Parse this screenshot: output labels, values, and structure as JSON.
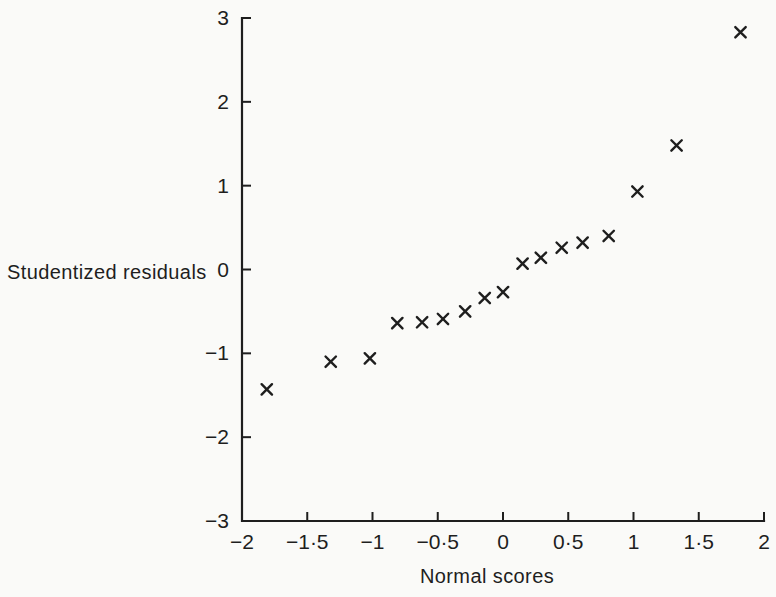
{
  "figure": {
    "paper_color": "#fafaf8",
    "ink_color": "#1e1e1e"
  },
  "chart_data": {
    "type": "scatter",
    "title": "",
    "xlabel": "Normal scores",
    "ylabel": "Studentized residuals",
    "xlim": [
      -2,
      2
    ],
    "ylim": [
      -3,
      3
    ],
    "grid": false,
    "legend_position": "none",
    "marker": "x",
    "x_ticks": [
      {
        "value": -2,
        "label": "−2"
      },
      {
        "value": -1.5,
        "label": "−1·5"
      },
      {
        "value": -1,
        "label": "−1"
      },
      {
        "value": -0.5,
        "label": "−0·5"
      },
      {
        "value": 0,
        "label": "0"
      },
      {
        "value": 0.5,
        "label": "0·5"
      },
      {
        "value": 1,
        "label": "1"
      },
      {
        "value": 1.5,
        "label": "1·5"
      },
      {
        "value": 2,
        "label": "2"
      }
    ],
    "y_ticks": [
      {
        "value": 3,
        "label": "3"
      },
      {
        "value": 2,
        "label": "2"
      },
      {
        "value": 1,
        "label": "1"
      },
      {
        "value": 0,
        "label": "0"
      },
      {
        "value": -1,
        "label": "−1"
      },
      {
        "value": -2,
        "label": "−2"
      },
      {
        "value": -3,
        "label": "−3"
      }
    ],
    "points": [
      {
        "x": -1.81,
        "y": -1.43
      },
      {
        "x": -1.32,
        "y": -1.1
      },
      {
        "x": -1.02,
        "y": -1.06
      },
      {
        "x": -0.81,
        "y": -0.64
      },
      {
        "x": -0.62,
        "y": -0.63
      },
      {
        "x": -0.46,
        "y": -0.59
      },
      {
        "x": -0.29,
        "y": -0.5
      },
      {
        "x": -0.14,
        "y": -0.34
      },
      {
        "x": 0.0,
        "y": -0.27
      },
      {
        "x": 0.15,
        "y": 0.07
      },
      {
        "x": 0.29,
        "y": 0.14
      },
      {
        "x": 0.45,
        "y": 0.26
      },
      {
        "x": 0.61,
        "y": 0.32
      },
      {
        "x": 0.81,
        "y": 0.4
      },
      {
        "x": 1.03,
        "y": 0.93
      },
      {
        "x": 1.33,
        "y": 1.48
      },
      {
        "x": 1.82,
        "y": 2.83
      }
    ]
  }
}
